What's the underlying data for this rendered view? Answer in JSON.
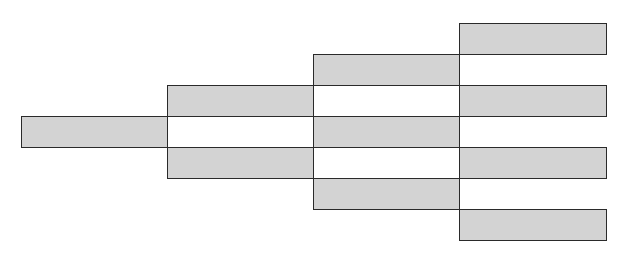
{
  "diagram": {
    "type": "binary-tree-block-diagram",
    "colors": {
      "fill": "#d3d3d3",
      "stroke": "#2a2a2a",
      "background": "#ffffff"
    },
    "columns": [
      {
        "x": 21,
        "width": 146,
        "blocks": [
          {
            "y": 116,
            "h": 31,
            "filled": true
          }
        ]
      },
      {
        "x": 167,
        "width": 146,
        "blocks": [
          {
            "y": 85,
            "h": 31,
            "filled": true
          },
          {
            "y": 116,
            "h": 31,
            "filled": false
          },
          {
            "y": 147,
            "h": 31,
            "filled": true
          }
        ]
      },
      {
        "x": 313,
        "width": 146,
        "blocks": [
          {
            "y": 54,
            "h": 31,
            "filled": true
          },
          {
            "y": 85,
            "h": 31,
            "filled": false
          },
          {
            "y": 116,
            "h": 31,
            "filled": true
          },
          {
            "y": 147,
            "h": 31,
            "filled": false
          },
          {
            "y": 178,
            "h": 31,
            "filled": true
          }
        ]
      },
      {
        "x": 459,
        "width": 147,
        "blocks": [
          {
            "y": 23,
            "h": 31,
            "filled": true
          },
          {
            "y": 85,
            "h": 31,
            "filled": true
          },
          {
            "y": 147,
            "h": 31,
            "filled": true
          },
          {
            "y": 209,
            "h": 31,
            "filled": true
          }
        ]
      }
    ]
  }
}
